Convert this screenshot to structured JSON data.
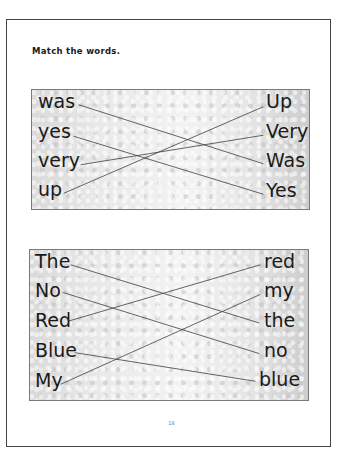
{
  "page": {
    "instruction": "Match the words.",
    "page_number": "18"
  },
  "exercises": [
    {
      "left_words": [
        "was",
        "yes",
        "very",
        "up"
      ],
      "right_words": [
        "Up",
        "Very",
        "Was",
        "Yes"
      ],
      "matches": [
        {
          "left": "was",
          "right": "Was"
        },
        {
          "left": "yes",
          "right": "Yes"
        },
        {
          "left": "very",
          "right": "Very"
        },
        {
          "left": "up",
          "right": "Up"
        }
      ]
    },
    {
      "left_words": [
        "The",
        "No",
        "Red",
        "Blue",
        "My"
      ],
      "right_words": [
        "red",
        "my",
        "the",
        "no",
        "blue"
      ],
      "matches": [
        {
          "left": "The",
          "right": "the"
        },
        {
          "left": "No",
          "right": "no"
        },
        {
          "left": "Red",
          "right": "red"
        },
        {
          "left": "Blue",
          "right": "blue"
        },
        {
          "left": "My",
          "right": "my"
        }
      ]
    }
  ],
  "colors": {
    "line": "#3d3d3d",
    "frame": "#444444",
    "box_border": "#7a7a7a",
    "text": "#1a1a1a"
  }
}
